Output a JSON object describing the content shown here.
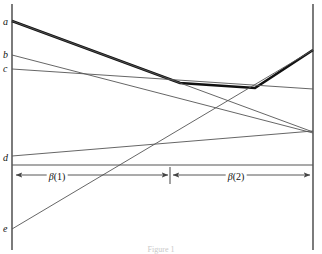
{
  "figure": {
    "caption": "Figure 1",
    "axis_labels": [
      {
        "name": "a",
        "text": "a",
        "x": 3,
        "y": 17
      },
      {
        "name": "b",
        "text": "b",
        "x": 3,
        "y": 50
      },
      {
        "name": "c",
        "text": "c",
        "x": 3,
        "y": 64
      },
      {
        "name": "d",
        "text": "d",
        "x": 3,
        "y": 153
      },
      {
        "name": "e",
        "text": "e",
        "x": 3,
        "y": 224
      }
    ],
    "span_labels": [
      {
        "name": "beta-1",
        "symbol": "β",
        "index": "(1)",
        "x": 57,
        "y": 172
      },
      {
        "name": "beta-2",
        "symbol": "β",
        "index": "(2)",
        "x": 236,
        "y": 172
      }
    ],
    "colors": {
      "ink": "#1a1a1a",
      "thin_line": "#555555",
      "thick_line": "#111111",
      "axis": "#444444",
      "background": "#ffffff",
      "caption": "#c9c9c9"
    }
  },
  "chart_data": {
    "type": "line",
    "title": "Figure 1",
    "xlabel": "",
    "ylabel": "",
    "xlim": [
      12,
      313
    ],
    "ylim": [
      254,
      0
    ],
    "grid": false,
    "legend": "none",
    "note": "Pixel coordinate space: x to the right, y downward. Upper values on the page are smaller y.",
    "axes": {
      "left_axis": {
        "x": 12,
        "y_top": 4,
        "y_bottom": 250
      },
      "right_axis": {
        "x": 313,
        "y_top": 4,
        "y_bottom": 250
      }
    },
    "annotations": [
      {
        "text": "β(1)",
        "x": 57,
        "y": 177,
        "kind": "span-label"
      },
      {
        "text": "β(2)",
        "x": 236,
        "y": 177,
        "kind": "span-label"
      },
      {
        "text": "divider-tick",
        "x": 170,
        "y": 175,
        "kind": "tick"
      }
    ],
    "span_arrows": [
      {
        "name": "beta-1-arrow",
        "y": 175,
        "x_start": 16,
        "x_end": 168,
        "arrow_left": true,
        "arrow_right": true
      },
      {
        "name": "beta-2-arrow",
        "y": 175,
        "x_start": 173,
        "x_end": 310,
        "arrow_left": true,
        "arrow_right": true
      }
    ],
    "series": [
      {
        "name": "upper-envelope",
        "label": "thick upper envelope",
        "style": "thick",
        "width": 2.6,
        "points": [
          [
            12,
            21
          ],
          [
            180,
            83
          ],
          [
            255,
            88
          ],
          [
            313,
            50
          ]
        ]
      },
      {
        "name": "line-a",
        "label": "a",
        "style": "thin",
        "width": 0.9,
        "points": [
          [
            12,
            21
          ],
          [
            313,
            132
          ]
        ]
      },
      {
        "name": "line-b",
        "label": "b",
        "style": "thin",
        "width": 0.9,
        "points": [
          [
            12,
            55
          ],
          [
            313,
            133
          ]
        ]
      },
      {
        "name": "line-c",
        "label": "c",
        "style": "thin",
        "width": 0.9,
        "points": [
          [
            12,
            69
          ],
          [
            313,
            89
          ]
        ]
      },
      {
        "name": "line-d",
        "label": "d",
        "style": "thin",
        "width": 0.9,
        "points": [
          [
            12,
            156
          ],
          [
            313,
            131
          ]
        ]
      },
      {
        "name": "line-e",
        "label": "e",
        "style": "thin",
        "width": 0.9,
        "points": [
          [
            12,
            229
          ],
          [
            313,
            50
          ]
        ]
      },
      {
        "name": "baseline-horizontal",
        "label": "horizontal baseline",
        "style": "thin",
        "width": 1.1,
        "points": [
          [
            12,
            165
          ],
          [
            313,
            165
          ]
        ]
      }
    ]
  }
}
